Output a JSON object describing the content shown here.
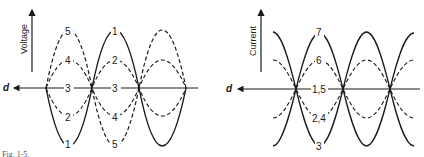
{
  "figure": {
    "caption_partial": "Fig. 1-5.",
    "left_panel": {
      "name": "voltage-standing-waves",
      "y_axis_label": "Voltage",
      "x_axis_label": "d",
      "curve_labels": {
        "top_seg1_outer": "5",
        "top_seg1_inner": "4",
        "top_seg2_outer": "1",
        "top_seg2_inner": "2",
        "axis_seg1": "3",
        "axis_seg2": "3",
        "bottom_seg1_inner": "2",
        "bottom_seg1_outer": "1",
        "bottom_seg2_inner": "4",
        "bottom_seg2_outer": "5"
      }
    },
    "right_panel": {
      "name": "current-standing-waves",
      "y_axis_label": "Current",
      "x_axis_label": "d",
      "curve_labels": {
        "top_outer": "7",
        "top_inner": "6",
        "axis": "1,5",
        "bottom_inner": "2,4",
        "bottom_outer": "3"
      }
    }
  },
  "colors": {
    "ink": "#1a1a1a",
    "background": "#ffffff"
  }
}
